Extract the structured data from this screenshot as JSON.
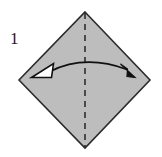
{
  "figure": {
    "kind": "origami-fold-diagram",
    "step_number": "1",
    "background_color": "#ffffff",
    "paper": {
      "name": "square-sheet-rotated-45",
      "fill_color": "#bdbdbd",
      "stroke_color": "#2b2b2b",
      "stroke_width": 1.6,
      "vertices": [
        {
          "label": "top",
          "x": 85,
          "y": 12
        },
        {
          "label": "right",
          "x": 150,
          "y": 80
        },
        {
          "label": "bottom",
          "x": 85,
          "y": 148
        },
        {
          "label": "left",
          "x": 19,
          "y": 80
        }
      ]
    },
    "crease_line": {
      "name": "vertical-valley-crease",
      "style": "dashed",
      "stroke_color": "#1a1a1a",
      "stroke_width": 1.4,
      "dash_pattern": "6 5",
      "from": {
        "x": 85,
        "y": 13
      },
      "to": {
        "x": 85,
        "y": 147
      }
    },
    "fold_arrow": {
      "name": "double-headed-fold-arrow",
      "stroke_color": "#111111",
      "stroke_width": 1.6,
      "arc": {
        "start": {
          "x": 50,
          "y": 72
        },
        "control": {
          "x": 85,
          "y": 54
        },
        "end": {
          "x": 128,
          "y": 70
        }
      },
      "head_left": {
        "style": "hollow",
        "fill_color": "#ffffff",
        "stroke_color": "#111111",
        "direction": "left"
      },
      "head_right": {
        "style": "solid",
        "fill_color": "#111111",
        "stroke_color": "#111111",
        "direction": "right-down"
      }
    }
  }
}
